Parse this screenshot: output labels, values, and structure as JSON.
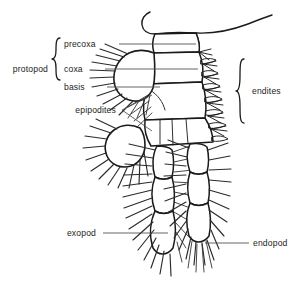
{
  "figure": {
    "background_color": "#ffffff",
    "ink_color": "#1a1a1a",
    "leader_color": "#4a4a4a",
    "width": 303,
    "height": 300
  },
  "labels": {
    "protopod": "protopod",
    "precoxa": "precoxa",
    "coxa": "coxa",
    "basis": "basis",
    "epipodites": "epipodites",
    "endites": "endites",
    "exopod": "exopod",
    "endopod": "endopod"
  },
  "parts": [
    {
      "name": "protopod",
      "label": "protopod",
      "side": "left",
      "kind": "bracket-group"
    },
    {
      "name": "precoxa",
      "label": "precoxa",
      "side": "left",
      "kind": "segment"
    },
    {
      "name": "coxa",
      "label": "coxa",
      "side": "left",
      "kind": "segment"
    },
    {
      "name": "basis",
      "label": "basis",
      "side": "left",
      "kind": "segment"
    },
    {
      "name": "epipodites",
      "label": "epipodites",
      "side": "left",
      "kind": "lobe-pair"
    },
    {
      "name": "endites",
      "label": "endites",
      "side": "right",
      "kind": "bracket-group"
    },
    {
      "name": "exopod",
      "label": "exopod",
      "side": "left",
      "kind": "ramus"
    },
    {
      "name": "endopod",
      "label": "endopod",
      "side": "right",
      "kind": "ramus"
    }
  ]
}
